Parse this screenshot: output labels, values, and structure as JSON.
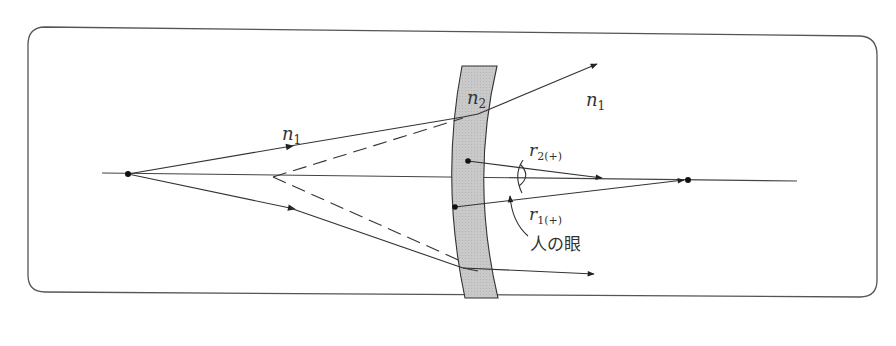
{
  "diagram": {
    "type": "optics-ray-diagram",
    "frame": {
      "shape": "rounded-rectangle",
      "stroke": "#444444"
    },
    "colors": {
      "line": "#333333",
      "lens_fill": "#c8c8c8",
      "background": "#ffffff"
    },
    "labels": {
      "medium_left": {
        "base": "n",
        "sub": "1"
      },
      "medium_lens": {
        "base": "n",
        "sub": "2"
      },
      "medium_right": {
        "base": "n",
        "sub": "1"
      },
      "radius_2": {
        "base": "r",
        "sub": "2(+)"
      },
      "radius_1": {
        "base": "r",
        "sub": "1(+)"
      },
      "eye_label": "人の眼"
    },
    "elements": [
      "optical-axis",
      "point-source",
      "virtual-image-point",
      "lens",
      "upper-ray",
      "lower-ray",
      "upper-dashed-extension",
      "lower-dashed-extension",
      "radius-r2-arrow",
      "radius-r1-arrow",
      "center-of-curvature-point",
      "eye-symbol",
      "eye-pointer-arrow"
    ]
  }
}
